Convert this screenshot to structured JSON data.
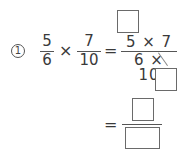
{
  "problem": {
    "number_label": "1",
    "left": {
      "fraction_a": {
        "numerator": "5",
        "denominator": "6"
      },
      "operator": "×",
      "fraction_b": {
        "numerator": "7",
        "denominator": "10"
      }
    },
    "equals": "=",
    "combined": {
      "numerator": "5 × 7",
      "denominator": "6 × 10",
      "cancel_numerator_box": "",
      "cancel_denominator_box": ""
    },
    "result": {
      "equals": "=",
      "numerator_box": "",
      "denominator_box": ""
    }
  }
}
